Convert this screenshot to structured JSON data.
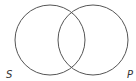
{
  "diagram": {
    "type": "venn",
    "stroke_color": "#555555",
    "sets": [
      {
        "label": "S",
        "cx": 50,
        "cy": 40,
        "r": 35
      },
      {
        "label": "P",
        "cx": 93,
        "cy": 40,
        "r": 35
      }
    ]
  }
}
